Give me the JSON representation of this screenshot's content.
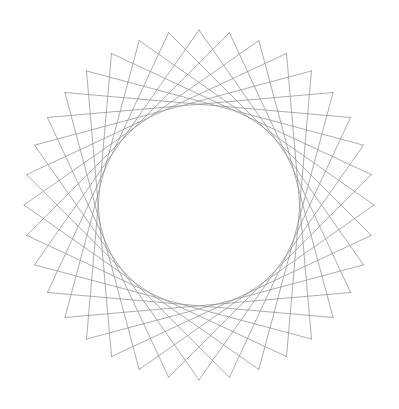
{
  "page": {
    "width": 399,
    "height": 409,
    "background_color": "#ffffff"
  },
  "figure": {
    "name": "circular-string-art",
    "center_x": 199,
    "center_y": 205,
    "outer_radius": 175,
    "inner_envelope_radius": 105,
    "point_count": 36,
    "skip": 11,
    "start_angle_deg": -90,
    "stroke_color": "#8c8c8c",
    "stroke_width": 0.75,
    "stroke_opacity": 0.95,
    "cusp_count": 36
  },
  "chart_data": {
    "type": "scatter",
    "subtitle": "",
    "xlabel": "",
    "ylabel": "",
    "xlim": [
      24,
      374
    ],
    "ylim": [
      30,
      380
    ],
    "grid": false,
    "legend": null,
    "annotations": [],
    "tick_labels_x": [],
    "tick_labels_y": [],
    "series": [
      {
        "name": "chords",
        "kind": "line-segments",
        "count": 36,
        "color": "#8c8c8c",
        "linewidth": 0.75,
        "description": "36 chords connecting vertex i to vertex (i+11) mod 36 on a circle of radius 175 centered at (199,205)"
      },
      {
        "name": "envelope-circle",
        "kind": "derived-caustic",
        "radius": 105,
        "color": "#8c8c8c",
        "description": "inner tangent circle formed as the envelope of the chord family"
      }
    ],
    "vertices_polar": {
      "radius": 175,
      "angles_deg": [
        -90,
        -80,
        -70,
        -60,
        -50,
        -40,
        -30,
        -20,
        -10,
        0,
        10,
        20,
        30,
        40,
        50,
        60,
        70,
        80,
        90,
        100,
        110,
        120,
        130,
        140,
        150,
        160,
        170,
        180,
        190,
        200,
        210,
        220,
        230,
        240,
        250,
        260
      ]
    }
  }
}
